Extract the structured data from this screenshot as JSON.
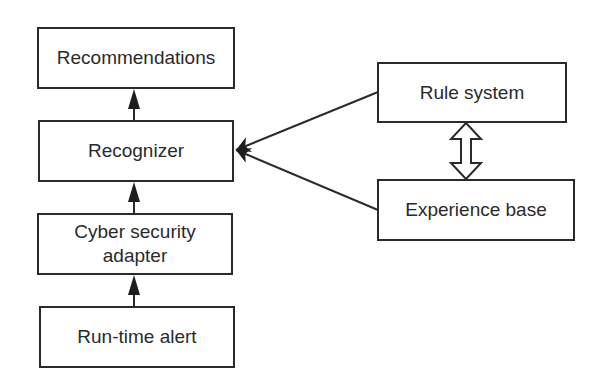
{
  "diagram": {
    "type": "flow",
    "nodes": [
      {
        "id": "recommendations",
        "label": "Recommendations"
      },
      {
        "id": "recognizer",
        "label": "Recognizer"
      },
      {
        "id": "cyber_security_adapter",
        "label": "Cyber security adapter"
      },
      {
        "id": "run_time_alert",
        "label": "Run-time alert"
      },
      {
        "id": "rule_system",
        "label": "Rule system"
      },
      {
        "id": "experience_base",
        "label": "Experience base"
      }
    ],
    "edges": [
      {
        "from": "run_time_alert",
        "to": "cyber_security_adapter",
        "style": "solid-arrow"
      },
      {
        "from": "cyber_security_adapter",
        "to": "recognizer",
        "style": "solid-arrow"
      },
      {
        "from": "recognizer",
        "to": "recommendations",
        "style": "solid-arrow"
      },
      {
        "from": "rule_system",
        "to": "recognizer",
        "style": "solid-arrow"
      },
      {
        "from": "experience_base",
        "to": "recognizer",
        "style": "solid-arrow"
      },
      {
        "from": "rule_system",
        "to": "experience_base",
        "style": "hollow-double-arrow"
      }
    ]
  },
  "colors": {
    "stroke": "#2a2a2a",
    "background": "#ffffff"
  }
}
